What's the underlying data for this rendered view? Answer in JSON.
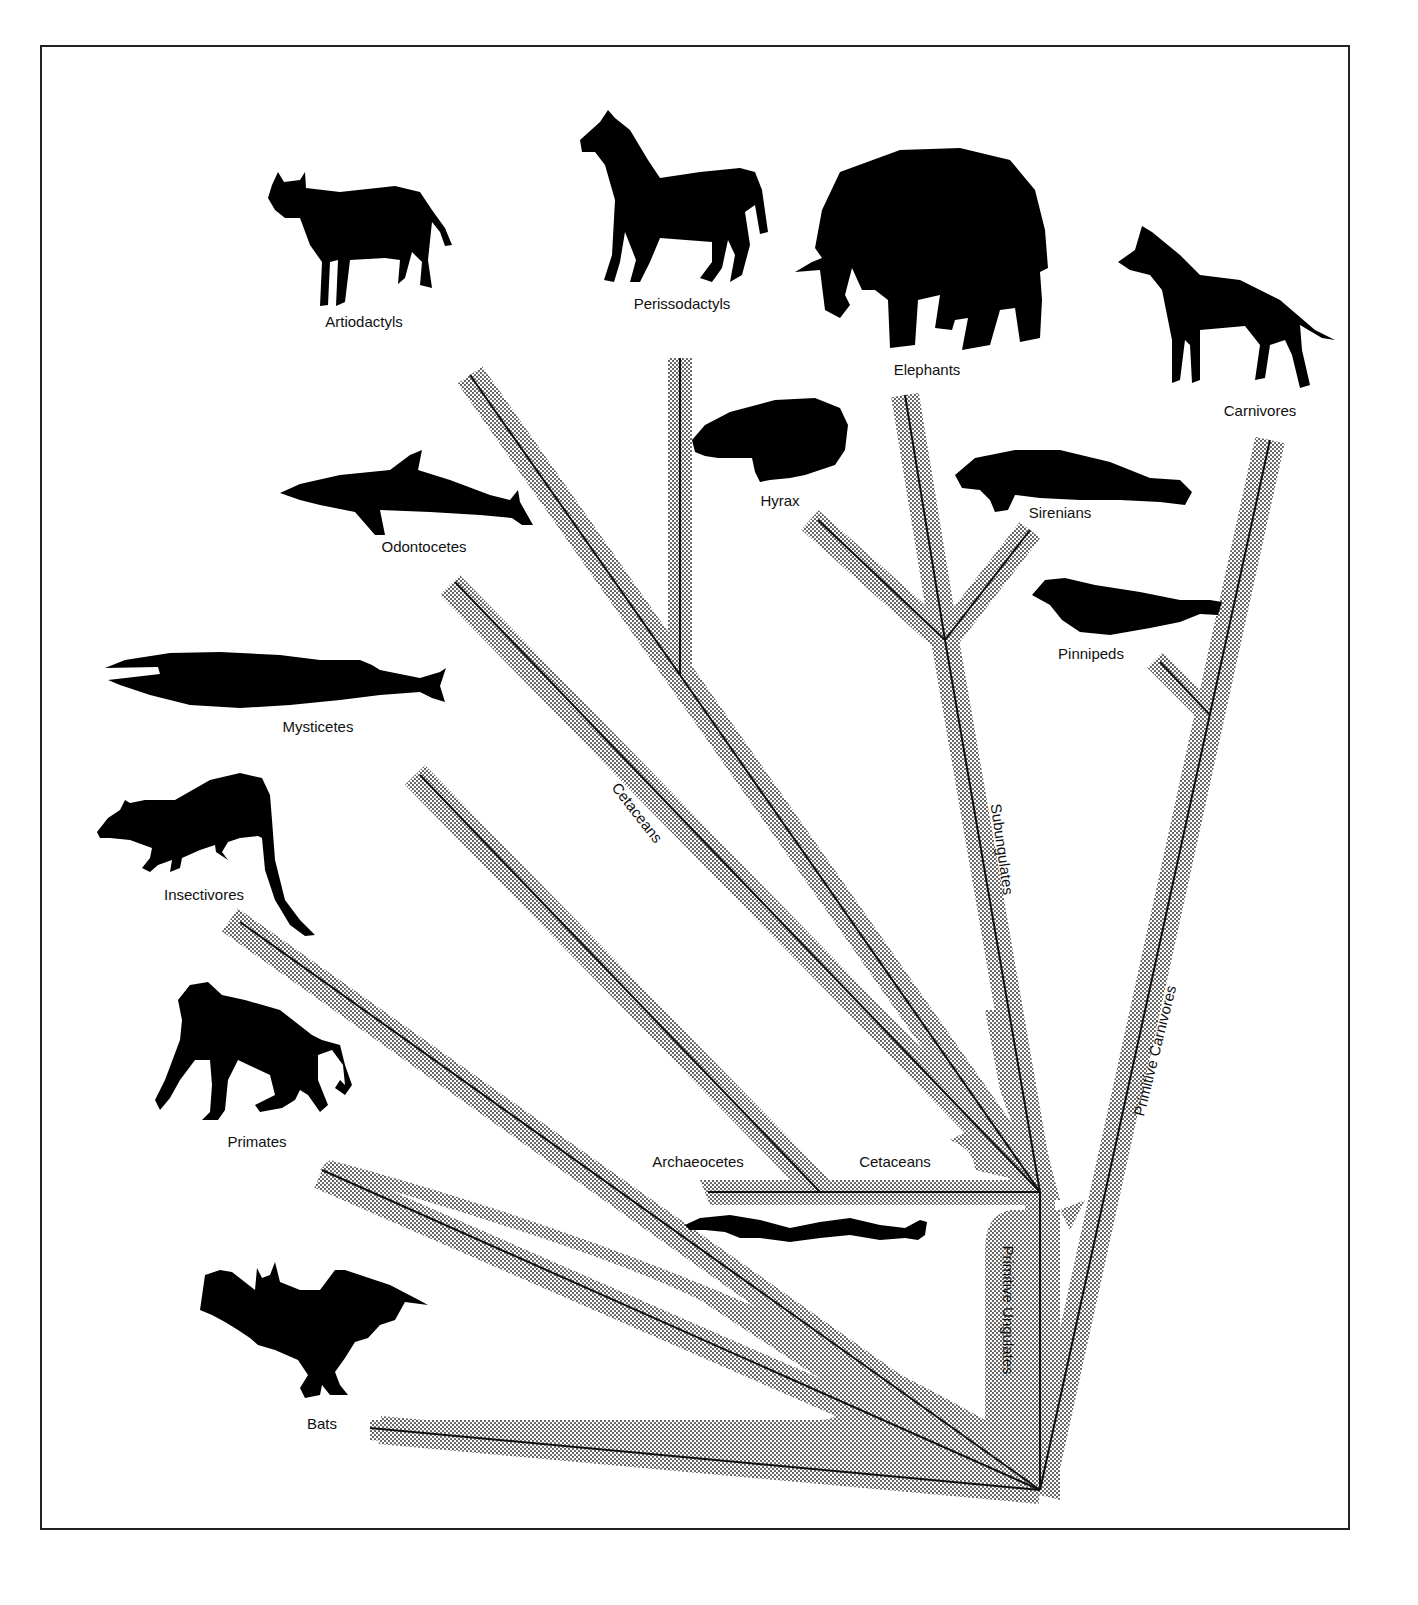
{
  "diagram": {
    "type": "phylogenetic-tree",
    "style": {
      "branch_color": "#111111",
      "halo_color": "#bdbdbd",
      "silhouette_color": "#000000",
      "frame_color": "#222222"
    },
    "taxa": [
      {
        "id": "artiodactyls",
        "label": "Artiodactyls",
        "animal": "cow"
      },
      {
        "id": "perissodactyls",
        "label": "Perissodactyls",
        "animal": "horse"
      },
      {
        "id": "elephants",
        "label": "Elephants",
        "animal": "elephant"
      },
      {
        "id": "carnivores",
        "label": "Carnivores",
        "animal": "dog"
      },
      {
        "id": "hyrax",
        "label": "Hyrax",
        "animal": "hyrax"
      },
      {
        "id": "sirenians",
        "label": "Sirenians",
        "animal": "manatee"
      },
      {
        "id": "pinnipeds",
        "label": "Pinnipeds",
        "animal": "seal"
      },
      {
        "id": "odontocetes",
        "label": "Odontocetes",
        "animal": "dolphin"
      },
      {
        "id": "mysticetes",
        "label": "Mysticetes",
        "animal": "baleen-whale"
      },
      {
        "id": "insectivores",
        "label": "Insectivores",
        "animal": "shrew"
      },
      {
        "id": "primates",
        "label": "Primates",
        "animal": "monkey"
      },
      {
        "id": "bats",
        "label": "Bats",
        "animal": "bat"
      },
      {
        "id": "archaeocetes",
        "label": "Archaeocetes",
        "animal": "basilosaurus"
      }
    ],
    "clade_labels": {
      "cetaceans_diagonal": "Cetaceans",
      "cetaceans_horizontal": "Cetaceans",
      "subungulates": "Subungulates",
      "primitive_carnivores": "Primitive Carnivores",
      "primitive_ungulates": "Primitive Ungulates"
    }
  }
}
